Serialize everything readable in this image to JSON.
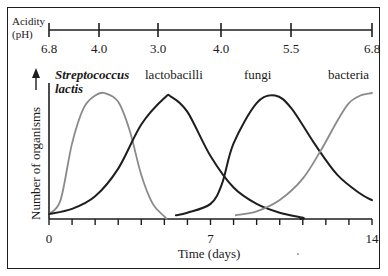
{
  "ph_axis": {
    "label_line1": "Acidity",
    "label_line2": "(pH)",
    "ticks": [
      {
        "value": "6.8",
        "x": 49
      },
      {
        "value": "4.0",
        "x": 99
      },
      {
        "value": "3.0",
        "x": 158
      },
      {
        "value": "4.0",
        "x": 221
      },
      {
        "value": "5.5",
        "x": 291
      },
      {
        "value": "6.8",
        "x": 372
      }
    ]
  },
  "x_axis": {
    "label": "Time (days)",
    "tick_labels": [
      {
        "value": "0",
        "day": 0
      },
      {
        "value": "7",
        "day": 7
      },
      {
        "value": "14",
        "day": 14
      }
    ],
    "min": 0,
    "max": 14,
    "tick_step": 1
  },
  "y_axis": {
    "label": "Number of organisms"
  },
  "series_labels": {
    "streptococcus_line1": "Streptococcus",
    "streptococcus_line2": "lactis",
    "lactobacilli": "lactobacilli",
    "fungi": "fungi",
    "bacteria": "bacteria"
  },
  "colors": {
    "dark": "#1e1e1e",
    "gray": "#8a8a8a",
    "frame": "#1f1f1f"
  },
  "chart_data": {
    "type": "line",
    "title": "",
    "xlabel": "Time (days)",
    "ylabel": "Number of organisms",
    "xlim": [
      0,
      14
    ],
    "ylim": [
      0,
      100
    ],
    "secondary_axis": {
      "label": "Acidity (pH)",
      "ticks": [
        "6.8",
        "4.0",
        "3.0",
        "4.0",
        "5.5",
        "6.8"
      ]
    },
    "series": [
      {
        "name": "Streptococcus lactis",
        "color": "gray",
        "x": [
          0,
          0.5,
          1,
          1.5,
          2,
          2.4,
          3,
          3.5,
          4,
          4.5,
          5,
          5.1
        ],
        "y": [
          4,
          15,
          60,
          88,
          98,
          100,
          93,
          70,
          35,
          12,
          2,
          0
        ]
      },
      {
        "name": "lactobacilli",
        "color": "dark",
        "x": [
          0,
          1,
          2,
          3,
          4,
          5,
          5.3,
          6,
          7,
          8,
          9,
          10,
          11,
          10.9
        ],
        "y": [
          4,
          8,
          18,
          40,
          75,
          96,
          97,
          85,
          50,
          25,
          12,
          5,
          1,
          0
        ]
      },
      {
        "name": "fungi",
        "color": "dark",
        "x": [
          5.5,
          6,
          7,
          7.5,
          8,
          9,
          9.8,
          10.5,
          11.5,
          12.5,
          13.5,
          14
        ],
        "y": [
          3,
          5,
          12,
          28,
          60,
          92,
          98,
          88,
          60,
          35,
          20,
          15
        ]
      },
      {
        "name": "bacteria",
        "color": "gray",
        "x": [
          8.1,
          9,
          10,
          11,
          11.8,
          12.5,
          13,
          13.5,
          14
        ],
        "y": [
          3,
          6,
          15,
          32,
          55,
          78,
          92,
          98,
          100
        ]
      }
    ]
  }
}
